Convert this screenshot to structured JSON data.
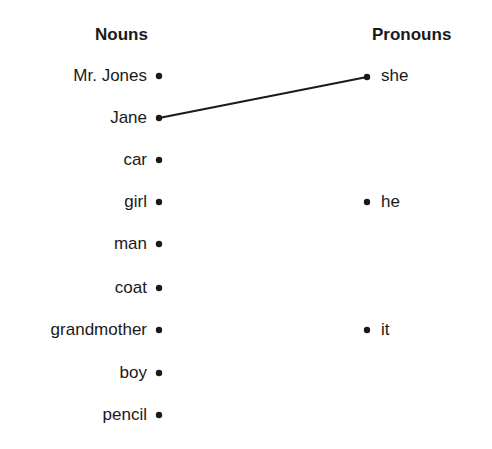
{
  "headings": {
    "nouns": "Nouns",
    "pronouns": "Pronouns"
  },
  "nouns": [
    "Mr. Jones",
    "Jane",
    "car",
    "girl",
    "man",
    "coat",
    "grandmother",
    "boy",
    "pencil"
  ],
  "pronouns": [
    "she",
    "he",
    "it"
  ],
  "connections": [
    {
      "noun": "Jane",
      "pronoun": "she"
    }
  ],
  "colors": {
    "ink": "#1a1a1a",
    "background": "#ffffff"
  }
}
